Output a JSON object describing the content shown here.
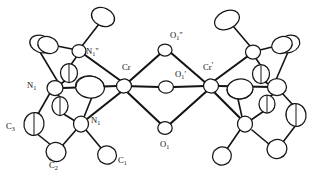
{
  "figure": {
    "caption": "",
    "background_color": "#ffffff",
    "line_color": "#141414",
    "ellipsoid_fill": "#ffffff",
    "width": 316,
    "height": 183
  },
  "atom_labels": {
    "cr_left": {
      "text": "Cr",
      "sub": "",
      "prime": "",
      "x": 122,
      "y": 70
    },
    "cr_right": {
      "text": "Cr",
      "sub": "",
      "prime": "'",
      "x": 203,
      "y": 70
    },
    "o_top": {
      "text": "O",
      "sub": "1",
      "prime": "''",
      "x": 170,
      "y": 38
    },
    "o_middle": {
      "text": "O",
      "sub": "1",
      "prime": "'",
      "x": 175,
      "y": 77
    },
    "o_bottom": {
      "text": "O",
      "sub": "1",
      "prime": "",
      "x": 166,
      "y": 147
    },
    "n_top": {
      "text": "N",
      "sub": "1",
      "prime": "''",
      "x": 86,
      "y": 54
    },
    "n_left": {
      "text": "N",
      "sub": "1",
      "prime": "",
      "x": 31,
      "y": 88
    },
    "n_bottom": {
      "text": "N",
      "sub": "1",
      "prime": "",
      "x": 91,
      "y": 123
    },
    "c1": {
      "text": "C",
      "sub": "1",
      "prime": "",
      "x": 118,
      "y": 163
    },
    "c2": {
      "text": "C",
      "sub": "2",
      "prime": "",
      "x": 53,
      "y": 168
    },
    "c3": {
      "text": "C",
      "sub": "3",
      "prime": "",
      "x": 10,
      "y": 129
    }
  },
  "metals": [
    {
      "name": "Cr",
      "cx": 124,
      "cy": 86,
      "rx": 7.5,
      "ry": 7.0,
      "rot": -4
    },
    {
      "name": "Cr'",
      "cx": 211,
      "cy": 86,
      "rx": 7.5,
      "ry": 7.0,
      "rot": 4
    }
  ],
  "bridging_oxygens": [
    {
      "name": "O1''",
      "cx": 165,
      "cy": 50,
      "rx": 7.0,
      "ry": 6.0,
      "rot": 0
    },
    {
      "name": "O1'",
      "cx": 166,
      "cy": 87,
      "rx": 7.5,
      "ry": 6.2,
      "rot": 0
    },
    {
      "name": "O1",
      "cx": 165,
      "cy": 128,
      "rx": 7.2,
      "ry": 6.4,
      "rot": 0
    }
  ],
  "ligand_atoms_left": [
    {
      "name": "N1''",
      "cx": 79,
      "cy": 51,
      "rx": 7.0,
      "ry": 6.5,
      "rot": 0
    },
    {
      "name": "Ctop",
      "cx": 103,
      "cy": 17,
      "rx": 12.0,
      "ry": 9.0,
      "rot": 25
    },
    {
      "name": "Cul",
      "cx": 41,
      "cy": 44,
      "rx": 11.5,
      "ry": 8.5,
      "rot": 20
    },
    {
      "name": "Cul2",
      "cx": 46,
      "cy": 45,
      "rx": 11.0,
      "ry": 8.2,
      "rot": 20
    },
    {
      "name": "Cmid1",
      "cx": 69,
      "cy": 73,
      "rx": 8.5,
      "ry": 9.5,
      "rot": 0
    },
    {
      "name": "N1",
      "cx": 55,
      "cy": 88,
      "rx": 8.0,
      "ry": 7.5,
      "rot": 0
    },
    {
      "name": "Cbig",
      "cx": 90,
      "cy": 87,
      "rx": 14.5,
      "ry": 11.0,
      "rot": 8
    },
    {
      "name": "Cmid2",
      "cx": 60,
      "cy": 106,
      "rx": 8.0,
      "ry": 9.5,
      "rot": 0
    },
    {
      "name": "C3",
      "cx": 34,
      "cy": 124,
      "rx": 10.0,
      "ry": 11.5,
      "rot": 10
    },
    {
      "name": "N1b",
      "cx": 81,
      "cy": 124,
      "rx": 7.5,
      "ry": 8.0,
      "rot": 0
    },
    {
      "name": "C2",
      "cx": 56,
      "cy": 152,
      "rx": 10.0,
      "ry": 9.5,
      "rot": 20
    },
    {
      "name": "C1",
      "cx": 107,
      "cy": 155,
      "rx": 9.5,
      "ry": 9.0,
      "rot": 25
    }
  ],
  "ligand_atoms_right": [
    {
      "name": "Ntop_r",
      "cx": 253,
      "cy": 52,
      "rx": 7.5,
      "ry": 7.0,
      "rot": 0
    },
    {
      "name": "Ctop_r",
      "cx": 227,
      "cy": 20,
      "rx": 13.0,
      "ry": 9.0,
      "rot": -25
    },
    {
      "name": "Cur",
      "cx": 288,
      "cy": 44,
      "rx": 11.0,
      "ry": 8.5,
      "rot": -20
    },
    {
      "name": "Cur2",
      "cx": 283,
      "cy": 45,
      "rx": 11.0,
      "ry": 8.5,
      "rot": -20
    },
    {
      "name": "Cmid1_r",
      "cx": 261,
      "cy": 74,
      "rx": 8.5,
      "ry": 9.5,
      "rot": 0
    },
    {
      "name": "Cbig_r",
      "cx": 240,
      "cy": 89,
      "rx": 13.0,
      "ry": 10.0,
      "rot": -8
    },
    {
      "name": "Nr",
      "cx": 277,
      "cy": 87,
      "rx": 9.5,
      "ry": 8.5,
      "rot": 0
    },
    {
      "name": "Cmid2_r",
      "cx": 267,
      "cy": 104,
      "rx": 8.0,
      "ry": 9.0,
      "rot": 0
    },
    {
      "name": "Cr3",
      "cx": 296,
      "cy": 115,
      "rx": 10.0,
      "ry": 11.5,
      "rot": -10
    },
    {
      "name": "Nrb",
      "cx": 245,
      "cy": 124,
      "rx": 7.5,
      "ry": 8.0,
      "rot": 0
    },
    {
      "name": "Cr2",
      "cx": 277,
      "cy": 149,
      "rx": 10.0,
      "ry": 9.5,
      "rot": -20
    },
    {
      "name": "Cr1",
      "cx": 222,
      "cy": 156,
      "rx": 9.5,
      "ry": 9.0,
      "rot": -25
    }
  ]
}
